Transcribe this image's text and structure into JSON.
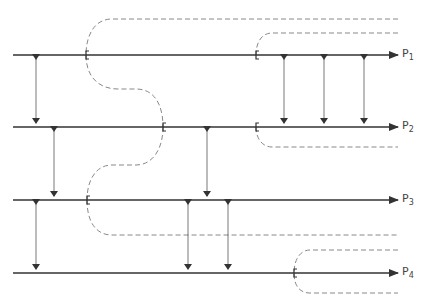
{
  "figure": {
    "top_caption_cropped": "",
    "stroke_color": "#333333",
    "dash_color": "#888888",
    "paths": [
      {
        "id": "P1",
        "label_main": "P",
        "label_sub": "1",
        "y": 55
      },
      {
        "id": "P2",
        "label_main": "P",
        "label_sub": "2",
        "y": 127
      },
      {
        "id": "P3",
        "label_main": "P",
        "label_sub": "3",
        "y": 200
      },
      {
        "id": "P4",
        "label_main": "P",
        "label_sub": "4",
        "y": 273
      }
    ],
    "line_start_x": 13,
    "line_end_x": 398,
    "brackets": [
      {
        "x": 86,
        "y": 55
      },
      {
        "x": 256,
        "y": 55
      },
      {
        "x": 163,
        "y": 127
      },
      {
        "x": 256,
        "y": 127
      },
      {
        "x": 87,
        "y": 200
      },
      {
        "x": 294,
        "y": 273
      }
    ],
    "double_arrows": [
      {
        "x": 36,
        "y1": 55,
        "y2": 127
      },
      {
        "x": 284,
        "y1": 55,
        "y2": 127
      },
      {
        "x": 324,
        "y1": 55,
        "y2": 127
      },
      {
        "x": 364,
        "y1": 55,
        "y2": 127
      },
      {
        "x": 54,
        "y1": 127,
        "y2": 200
      },
      {
        "x": 207,
        "y1": 127,
        "y2": 200
      },
      {
        "x": 36,
        "y1": 200,
        "y2": 273
      },
      {
        "x": 188,
        "y1": 200,
        "y2": 273
      },
      {
        "x": 228,
        "y1": 200,
        "y2": 273
      }
    ]
  }
}
